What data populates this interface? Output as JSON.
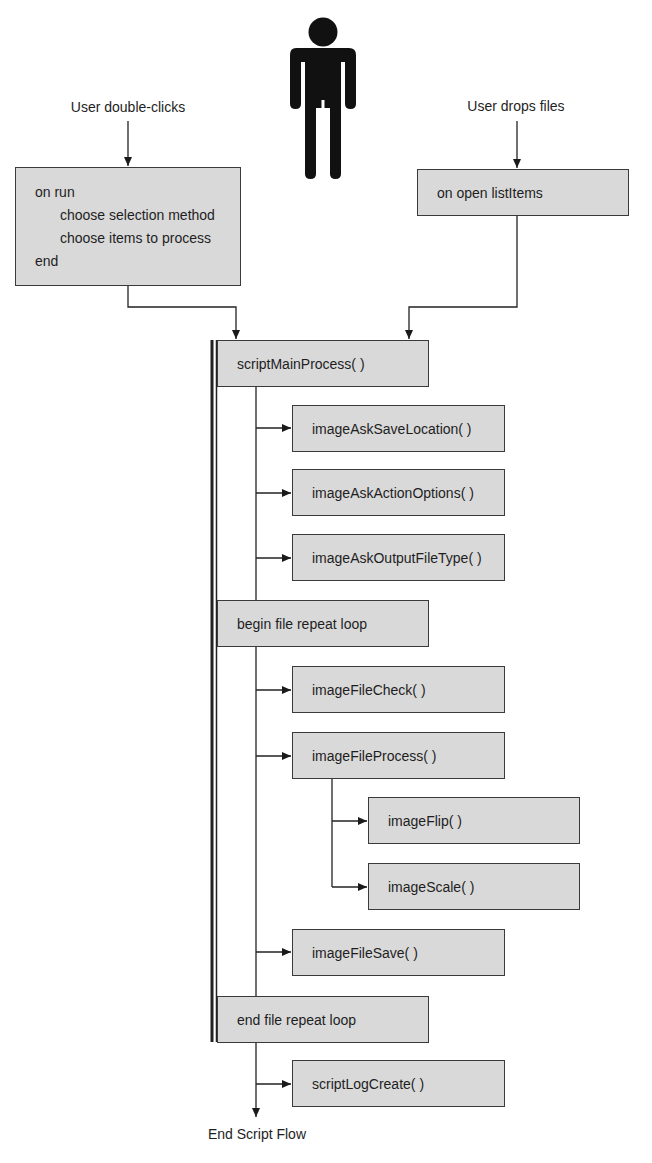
{
  "diagram": {
    "actor": {
      "icon": "person-icon"
    },
    "triggers": {
      "double_click": "User double-clicks",
      "drop_files": "User drops files"
    },
    "handlers": {
      "run": {
        "lines": [
          "on run",
          "choose selection method",
          "choose items to process",
          "end"
        ]
      },
      "open": {
        "label": "on open listItems"
      }
    },
    "flow": {
      "script_main_process": "scriptMainProcess( )",
      "ask_save_location": "imageAskSaveLocation( )",
      "ask_action_options": "imageAskActionOptions( )",
      "ask_output_file_type": "imageAskOutputFileType( )",
      "begin_loop": "begin file repeat loop",
      "file_check": "imageFileCheck( )",
      "file_process": "imageFileProcess( )",
      "image_flip": "imageFlip( )",
      "image_scale": "imageScale( )",
      "file_save": "imageFileSave( )",
      "end_loop": "end file repeat loop",
      "log_create": "scriptLogCreate( )"
    },
    "end_label": "End Script Flow"
  },
  "colors": {
    "box_fill": "#d9d9d9",
    "box_border": "#3a3a3a",
    "line": "#222222",
    "text": "#1e1e1e"
  }
}
